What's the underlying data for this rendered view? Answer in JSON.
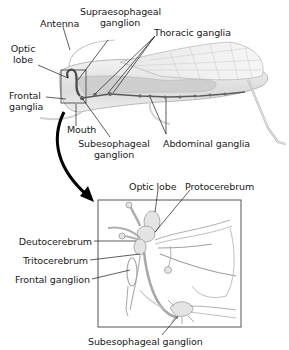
{
  "figure": {
    "top_panel": {
      "subject": "grasshopper",
      "labels": {
        "antenna": "Antenna",
        "supraesophageal_1": "Supraesophageal",
        "supraesophageal_2": "ganglion",
        "thoracic": "Thoracic ganglia",
        "optic_1": "Optic",
        "optic_2": "lobe",
        "frontal_1": "Frontal",
        "frontal_2": "ganglia",
        "mouth": "Mouth",
        "subesophageal_1": "Subesophageal",
        "subesophageal_2": "ganglion",
        "abdominal": "Abdominal ganglia"
      }
    },
    "inset_panel": {
      "subject": "brain detail",
      "labels": {
        "optic_lobe": "Optic lobe",
        "protocerebrum": "Protocerebrum",
        "deutocerebrum": "Deutocerebrum",
        "tritocerebrum": "Tritocerebrum",
        "frontal_ganglion": "Frontal ganglion",
        "subesophageal_ganglion": "Subesophageal ganglion"
      }
    },
    "colors": {
      "line": "#1a1a1a",
      "body_fill": "#e6e6e6",
      "body_stroke": "#9a9a9a",
      "nerve_fill": "#cfcfcf"
    }
  }
}
